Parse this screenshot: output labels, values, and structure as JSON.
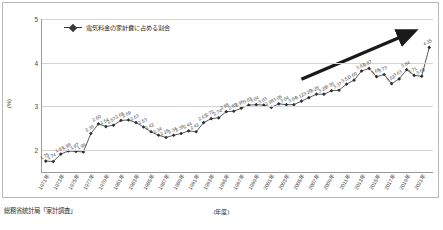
{
  "legend": {
    "label": "電気料金の家計費に占める割合",
    "marker": "diamond-marker-icon"
  },
  "axes": {
    "y_unit": "(%)",
    "y_ticks": [
      "5",
      "4",
      "3",
      "2"
    ],
    "y_min": 1.5,
    "y_max": 5,
    "x_title": "(年度)"
  },
  "source": {
    "note": "総務省統計局「家計調査」"
  },
  "annotation": {
    "name": "upward-trend-arrow",
    "color": "#1a1a1a"
  },
  "chart_data": {
    "type": "line",
    "title": "",
    "subtitle": "",
    "xlabel": "(年度)",
    "ylabel": "(%)",
    "ylim": [
      1.5,
      5
    ],
    "grid": true,
    "legend_position": "top-left",
    "series_name": "電気料金の家計費に占める割合",
    "categories": [
      "1971年",
      "1972年",
      "1973年",
      "1974年",
      "1975年",
      "1976年",
      "1977年",
      "1978年",
      "1979年",
      "1980年",
      "1981年",
      "1982年",
      "1983年",
      "1984年",
      "1985年",
      "1986年",
      "1987年",
      "1988年",
      "1989年",
      "1990年",
      "1991年",
      "1992年",
      "1993年",
      "1994年",
      "1995年",
      "1996年",
      "1997年",
      "1998年",
      "1999年",
      "2000年",
      "2001年",
      "2002年",
      "2003年",
      "2004年",
      "2005年",
      "2006年",
      "2007年",
      "2008年",
      "2009年",
      "2010年",
      "2011年",
      "2012年",
      "2013年",
      "2014年",
      "2015年",
      "2016年",
      "2017年",
      "2018年",
      "2019年",
      "2020年",
      "2021年",
      "2022年"
    ],
    "x_tick_labels": [
      "1971年",
      "1973年",
      "1975年",
      "1977年",
      "1979年",
      "1981年",
      "1983年",
      "1985年",
      "1987年",
      "1989年",
      "1991年",
      "1993年",
      "1995年",
      "1997年",
      "1999年",
      "2001年",
      "2003年",
      "2005年",
      "2007年",
      "2009年",
      "2011年",
      "2013年",
      "2015年",
      "2017年",
      "2019年",
      "2021年"
    ],
    "values": [
      1.75,
      1.74,
      1.91,
      1.98,
      1.97,
      1.96,
      2.38,
      2.6,
      2.54,
      2.57,
      2.68,
      2.69,
      2.63,
      2.53,
      2.42,
      2.34,
      2.29,
      2.34,
      2.38,
      2.44,
      2.42,
      2.63,
      2.72,
      2.74,
      2.88,
      2.89,
      2.96,
      3.03,
      3.04,
      3.03,
      2.98,
      3.06,
      3.04,
      3.04,
      3.12,
      3.2,
      3.28,
      3.28,
      3.36,
      3.37,
      3.51,
      3.6,
      3.81,
      3.87,
      3.68,
      3.73,
      3.52,
      3.63,
      3.84,
      3.71,
      3.69,
      4.35
    ],
    "value_labels": [
      "1.75",
      "1.74",
      "1.91",
      "1.98",
      "1.97",
      "1.96",
      "2.38",
      "2.60",
      "2.54",
      "2.57",
      "2.68",
      "2.69",
      "2.63",
      "2.53",
      "2.42",
      "2.34",
      "2.29",
      "2.34",
      "2.38",
      "2.44",
      "2.42",
      "2.63",
      "2.72",
      "2.74",
      "2.88",
      "2.89",
      "2.96",
      "3.03",
      "3.04",
      "3.03",
      "2.98",
      "3.06",
      "3.04",
      "3.04",
      "3.12",
      "3.20",
      "3.28",
      "3.28",
      "3.36",
      "3.37",
      "3.51",
      "3.60",
      "3.81",
      "3.87",
      "3.68",
      "3.73",
      "3.52",
      "3.63",
      "3.84",
      "3.71",
      "3.69",
      "4.35"
    ]
  }
}
